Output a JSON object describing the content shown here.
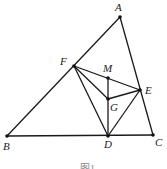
{
  "diagram": {
    "points": {
      "A": {
        "label": "A",
        "x": 120,
        "y": 17,
        "lx": 115,
        "ly": 11
      },
      "B": {
        "label": "B",
        "x": 7,
        "y": 136,
        "lx": 3,
        "ly": 150
      },
      "C": {
        "label": "C",
        "x": 153,
        "y": 135,
        "lx": 155,
        "ly": 146
      },
      "D": {
        "label": "D",
        "x": 108,
        "y": 136,
        "lx": 104,
        "ly": 148
      },
      "E": {
        "label": "E",
        "x": 140,
        "y": 90,
        "lx": 145,
        "ly": 94
      },
      "F": {
        "label": "F",
        "x": 74,
        "y": 66,
        "lx": 60,
        "ly": 65
      },
      "G": {
        "label": "G",
        "x": 108,
        "y": 99,
        "lx": 110,
        "ly": 111
      },
      "M": {
        "label": "M",
        "x": 108,
        "y": 78,
        "lx": 103,
        "ly": 72
      }
    },
    "segments": [
      [
        "A",
        "B"
      ],
      [
        "A",
        "C"
      ],
      [
        "B",
        "C"
      ],
      [
        "F",
        "E"
      ],
      [
        "F",
        "G"
      ],
      [
        "F",
        "D"
      ],
      [
        "M",
        "D"
      ],
      [
        "G",
        "E"
      ],
      [
        "E",
        "D"
      ]
    ],
    "caption": "图1"
  }
}
